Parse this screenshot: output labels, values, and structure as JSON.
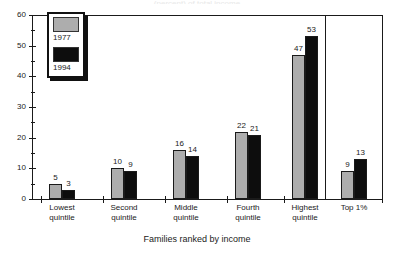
{
  "chart_data": {
    "type": "bar",
    "title": "",
    "title_clipped": "(percent) of total income",
    "xlabel": "Families ranked by income",
    "ylabel": "",
    "ylim": [
      0,
      60
    ],
    "ytick_major_step": 10,
    "ytick_minor_step": 5,
    "ytick_labels": [
      "60",
      "50",
      "40",
      "30",
      "20",
      "10",
      "0"
    ],
    "grid": false,
    "legend_position": "top-left-inside",
    "categories": [
      "Lowest quintile",
      "Second quintile",
      "Middle quintile",
      "Fourth quintile",
      "Highest quintile",
      "Top 1%"
    ],
    "category_lines": [
      [
        "Lowest",
        "quintile"
      ],
      [
        "Second",
        "quintile"
      ],
      [
        "Middle",
        "quintile"
      ],
      [
        "Fourth",
        "quintile"
      ],
      [
        "Highest",
        "quintile"
      ],
      [
        "Top 1%",
        ""
      ]
    ],
    "series": [
      {
        "name": "1977",
        "color": "#adadad",
        "values": [
          5,
          10,
          16,
          22,
          47,
          9
        ]
      },
      {
        "name": "1994",
        "color": "#0d0d0d",
        "values": [
          3,
          9,
          14,
          21,
          53,
          13
        ]
      }
    ],
    "annotations": {
      "divider_note": "vertical rule separates Top 1% panel from the quintile panel"
    }
  },
  "legend": {
    "entries": [
      {
        "label": "1977",
        "swatch": "gray-swatch"
      },
      {
        "label": "1994",
        "swatch": "black-swatch"
      }
    ]
  },
  "axis": {
    "x_title": "Families ranked by income"
  }
}
